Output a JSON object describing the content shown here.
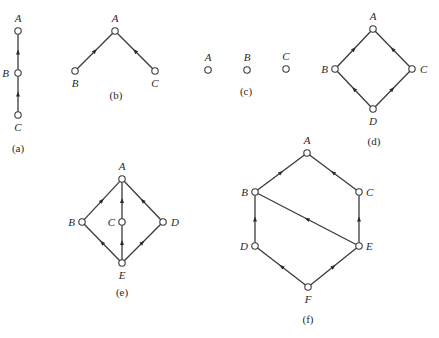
{
  "figure": {
    "panels": [
      {
        "caption": "(a)",
        "caption_pos": [
          18,
          152
        ],
        "nodes": [
          {
            "id": "A",
            "x": 18,
            "y": 31,
            "label": "A",
            "lx": 18,
            "ly": 22,
            "anchor": "middle"
          },
          {
            "id": "B",
            "x": 18,
            "y": 73,
            "label": "B",
            "lx": 9,
            "ly": 77,
            "anchor": "end"
          },
          {
            "id": "C",
            "x": 18,
            "y": 115,
            "label": "C",
            "lx": 18,
            "ly": 131,
            "anchor": "middle"
          }
        ],
        "edges": [
          {
            "from": "B",
            "to": "A"
          },
          {
            "from": "C",
            "to": "B"
          }
        ]
      },
      {
        "caption": "(b)",
        "caption_pos": [
          116,
          99
        ],
        "nodes": [
          {
            "id": "A",
            "x": 115,
            "y": 31,
            "label": "A",
            "lx": 115,
            "ly": 22,
            "anchor": "middle"
          },
          {
            "id": "B",
            "x": 75,
            "y": 71,
            "label": "B",
            "lx": 75,
            "ly": 87,
            "anchor": "middle"
          },
          {
            "id": "C",
            "x": 155,
            "y": 71,
            "label": "C",
            "lx": 155,
            "ly": 87,
            "anchor": "middle"
          }
        ],
        "edges": [
          {
            "from": "B",
            "to": "A"
          },
          {
            "from": "C",
            "to": "A"
          }
        ]
      },
      {
        "caption": "(c)",
        "caption_pos": [
          246,
          95
        ],
        "nodes": [
          {
            "id": "A",
            "x": 208,
            "y": 70,
            "label": "A",
            "lx": 208,
            "ly": 61,
            "anchor": "middle"
          },
          {
            "id": "B",
            "x": 247,
            "y": 70,
            "label": "B",
            "lx": 247,
            "ly": 61,
            "anchor": "middle"
          },
          {
            "id": "C",
            "x": 286,
            "y": 69,
            "label": "C",
            "lx": 286,
            "ly": 60,
            "anchor": "middle"
          }
        ],
        "edges": []
      },
      {
        "caption": "(d)",
        "caption_pos": [
          374,
          145
        ],
        "nodes": [
          {
            "id": "A",
            "x": 373,
            "y": 29,
            "label": "A",
            "lx": 373,
            "ly": 20,
            "anchor": "middle"
          },
          {
            "id": "B",
            "x": 335,
            "y": 69,
            "label": "B",
            "lx": 328,
            "ly": 73,
            "anchor": "end"
          },
          {
            "id": "C",
            "x": 412,
            "y": 69,
            "label": "C",
            "lx": 420,
            "ly": 73,
            "anchor": "start"
          },
          {
            "id": "D",
            "x": 373,
            "y": 109,
            "label": "D",
            "lx": 373,
            "ly": 125,
            "anchor": "middle"
          }
        ],
        "edges": [
          {
            "from": "B",
            "to": "A"
          },
          {
            "from": "C",
            "to": "A"
          },
          {
            "from": "D",
            "to": "B"
          },
          {
            "from": "D",
            "to": "C"
          }
        ]
      },
      {
        "caption": "(e)",
        "caption_pos": [
          122,
          296
        ],
        "nodes": [
          {
            "id": "A",
            "x": 122,
            "y": 179,
            "label": "A",
            "lx": 122,
            "ly": 170,
            "anchor": "middle"
          },
          {
            "id": "B",
            "x": 82,
            "y": 222,
            "label": "B",
            "lx": 75,
            "ly": 226,
            "anchor": "end"
          },
          {
            "id": "C",
            "x": 122,
            "y": 222,
            "label": "C",
            "lx": 115,
            "ly": 226,
            "anchor": "end"
          },
          {
            "id": "D",
            "x": 163,
            "y": 222,
            "label": "D",
            "lx": 171,
            "ly": 226,
            "anchor": "start"
          },
          {
            "id": "E",
            "x": 122,
            "y": 263,
            "label": "E",
            "lx": 122,
            "ly": 279,
            "anchor": "middle"
          }
        ],
        "edges": [
          {
            "from": "B",
            "to": "A"
          },
          {
            "from": "C",
            "to": "A"
          },
          {
            "from": "D",
            "to": "A"
          },
          {
            "from": "E",
            "to": "B"
          },
          {
            "from": "E",
            "to": "C"
          },
          {
            "from": "E",
            "to": "D"
          }
        ]
      },
      {
        "caption": "(f)",
        "caption_pos": [
          308,
          323
        ],
        "nodes": [
          {
            "id": "A",
            "x": 307,
            "y": 153,
            "label": "A",
            "lx": 307,
            "ly": 144,
            "anchor": "middle"
          },
          {
            "id": "B",
            "x": 255,
            "y": 192,
            "label": "B",
            "lx": 248,
            "ly": 196,
            "anchor": "end"
          },
          {
            "id": "C",
            "x": 359,
            "y": 192,
            "label": "C",
            "lx": 366,
            "ly": 196,
            "anchor": "start"
          },
          {
            "id": "D",
            "x": 255,
            "y": 246,
            "label": "D",
            "lx": 248,
            "ly": 250,
            "anchor": "end"
          },
          {
            "id": "E",
            "x": 359,
            "y": 246,
            "label": "E",
            "lx": 366,
            "ly": 250,
            "anchor": "start"
          },
          {
            "id": "F",
            "x": 308,
            "y": 287,
            "label": "F",
            "lx": 308,
            "ly": 303,
            "anchor": "middle"
          }
        ],
        "edges": [
          {
            "from": "B",
            "to": "A"
          },
          {
            "from": "C",
            "to": "A"
          },
          {
            "from": "D",
            "to": "B"
          },
          {
            "from": "E",
            "to": "B"
          },
          {
            "from": "E",
            "to": "C"
          },
          {
            "from": "F",
            "to": "D"
          },
          {
            "from": "F",
            "to": "E"
          }
        ]
      }
    ]
  }
}
